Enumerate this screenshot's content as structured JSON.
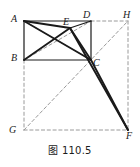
{
  "figure": {
    "caption": "图 110.5",
    "colors": {
      "solid_stroke": "#1a1a1a",
      "dashed_stroke": "#9a9a9a",
      "background": "#ffffff",
      "label_color": "#1b1b1b"
    },
    "points": {
      "A": {
        "label": "A",
        "x": 24,
        "y": 21,
        "label_x": 11,
        "label_y": 14
      },
      "B": {
        "label": "B",
        "x": 24,
        "y": 60,
        "label_x": 11,
        "label_y": 53
      },
      "C": {
        "label": "C",
        "x": 91,
        "y": 60,
        "label_x": 93,
        "label_y": 58
      },
      "D": {
        "label": "D",
        "x": 91,
        "y": 21,
        "label_x": 83,
        "label_y": 10
      },
      "E": {
        "label": "E",
        "x": 70,
        "y": 28,
        "label_x": 63,
        "label_y": 17
      },
      "F": {
        "label": "F",
        "x": 128,
        "y": 130,
        "label_x": 126,
        "label_y": 131
      },
      "G": {
        "label": "G",
        "x": 24,
        "y": 130,
        "label_x": 9,
        "label_y": 125
      },
      "H": {
        "label": "H",
        "x": 128,
        "y": 21,
        "label_x": 123,
        "label_y": 10
      }
    },
    "solid_segments": [
      {
        "name": "side-AB",
        "from": "A",
        "to": "B",
        "width": 1.2
      },
      {
        "name": "side-AD",
        "from": "A",
        "to": "D",
        "width": 1.2
      },
      {
        "name": "side-BC",
        "from": "B",
        "to": "C",
        "width": 1.2
      },
      {
        "name": "side-DC",
        "from": "D",
        "to": "C",
        "width": 1.2
      },
      {
        "name": "diagonal-AC",
        "from": "A",
        "to": "C",
        "width": 1.9
      },
      {
        "name": "segment-AE",
        "from": "A",
        "to": "E",
        "width": 1.9
      },
      {
        "name": "segment-BE",
        "from": "B",
        "to": "E",
        "width": 1.9
      },
      {
        "name": "segment-EC",
        "from": "E",
        "to": "C",
        "width": 1.9
      },
      {
        "name": "segment-ED",
        "from": "E",
        "to": "D",
        "width": 1.2
      },
      {
        "name": "segment-EF",
        "from": "E",
        "to": "F",
        "width": 1.9
      },
      {
        "name": "segment-CF",
        "from": "C",
        "to": "F",
        "width": 1.9
      }
    ],
    "dashed_segments": [
      {
        "name": "diagonal-BD",
        "from": "B",
        "to": "D",
        "width": 1.0
      },
      {
        "name": "segment-AC-guide",
        "from": "A",
        "to": "C",
        "width": 1.0
      },
      {
        "name": "segment-DH",
        "from": "D",
        "to": "H",
        "width": 1.0
      },
      {
        "name": "segment-BG",
        "from": "B",
        "to": "G",
        "width": 1.0
      },
      {
        "name": "segment-GF",
        "from": "G",
        "to": "F",
        "width": 1.0
      },
      {
        "name": "segment-HF",
        "from": "H",
        "to": "F",
        "width": 1.0
      },
      {
        "name": "diagonal-GH",
        "from": "G",
        "to": "H",
        "width": 1.0
      }
    ]
  }
}
